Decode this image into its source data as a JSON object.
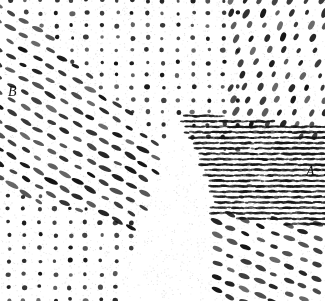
{
  "figure": {
    "type": "lattice-micrograph",
    "width": 325,
    "height": 301,
    "background_color": "#ffffff",
    "dot_color": "#141414"
  },
  "labels": {
    "region_a": "A",
    "region_b": "B"
  },
  "chart_data": {
    "type": "scatter",
    "title": "",
    "xlabel": "",
    "ylabel": "",
    "xlim": [
      0,
      325
    ],
    "ylim": [
      0,
      301
    ],
    "grid": false,
    "legend": "none",
    "annotations": [
      {
        "text": "B",
        "x": 14,
        "y": 92,
        "style": "italic-serif"
      },
      {
        "text": "A",
        "x": 312,
        "y": 172,
        "style": "italic-serif"
      }
    ],
    "domains": [
      {
        "name": "upper-square-lattice",
        "label": "",
        "lattice": "square",
        "origin": [
          26,
          13
        ],
        "spacing_x": 15.2,
        "spacing_y": 12.4,
        "shear": 0.0,
        "rotation_deg": 0,
        "dot_radius": 2.1,
        "elongation": 1.0,
        "elongation_angle_deg": 0,
        "clip": "top-band"
      },
      {
        "name": "upper-right-tilted-lattice",
        "label": "",
        "lattice": "oblique",
        "origin": [
          232,
          13
        ],
        "spacing_x": 15.2,
        "spacing_y": 12.4,
        "shear": 0.18,
        "rotation_deg": 0,
        "dot_radius": 2.2,
        "elongation": 1.7,
        "elongation_angle_deg": -62,
        "clip": "top-right"
      },
      {
        "name": "region-B-diagonal-lattice",
        "label": "B",
        "lattice": "oblique-diagonal",
        "origin": [
          24,
          64
        ],
        "spacing_x": 15.4,
        "spacing_y": 12.2,
        "shear": 0.62,
        "rotation_deg": 31,
        "dot_radius": 2.0,
        "elongation": 2.6,
        "elongation_angle_deg": 28,
        "clip": "left-wedge"
      },
      {
        "name": "region-B-lower-square-lattice",
        "label": "B",
        "lattice": "square",
        "origin": [
          24,
          196
        ],
        "spacing_x": 15.4,
        "spacing_y": 13.0,
        "shear": 0.0,
        "rotation_deg": 0,
        "dot_radius": 2.1,
        "elongation": 1.0,
        "elongation_angle_deg": 0,
        "clip": "bottom-left"
      },
      {
        "name": "region-A-dense-fringe-lattice",
        "label": "A",
        "lattice": "dense-horizontal-fringe",
        "origin": [
          186,
          116
        ],
        "spacing_x": 4.3,
        "spacing_y": 5.4,
        "shear": 0.05,
        "rotation_deg": 0,
        "dot_radius": 1.2,
        "elongation": 2.4,
        "elongation_angle_deg": 0,
        "clip": "right-block"
      },
      {
        "name": "region-A-lower-diagonal-lattice",
        "label": "A",
        "lattice": "oblique-diagonal",
        "origin": [
          188,
          210
        ],
        "spacing_x": 15.6,
        "spacing_y": 12.6,
        "shear": 0.42,
        "rotation_deg": 23,
        "dot_radius": 2.1,
        "elongation": 2.3,
        "elongation_angle_deg": 22,
        "clip": "bottom-right"
      }
    ],
    "boundary": {
      "kind": "wedge",
      "description": "White wedge of unimaged material separating domain B (left) from domain A (right)",
      "vertices": [
        [
          178,
          118
        ],
        [
          152,
          182
        ],
        [
          118,
          301
        ],
        [
          212,
          301
        ],
        [
          212,
          196
        ],
        [
          196,
          150
        ]
      ]
    }
  }
}
